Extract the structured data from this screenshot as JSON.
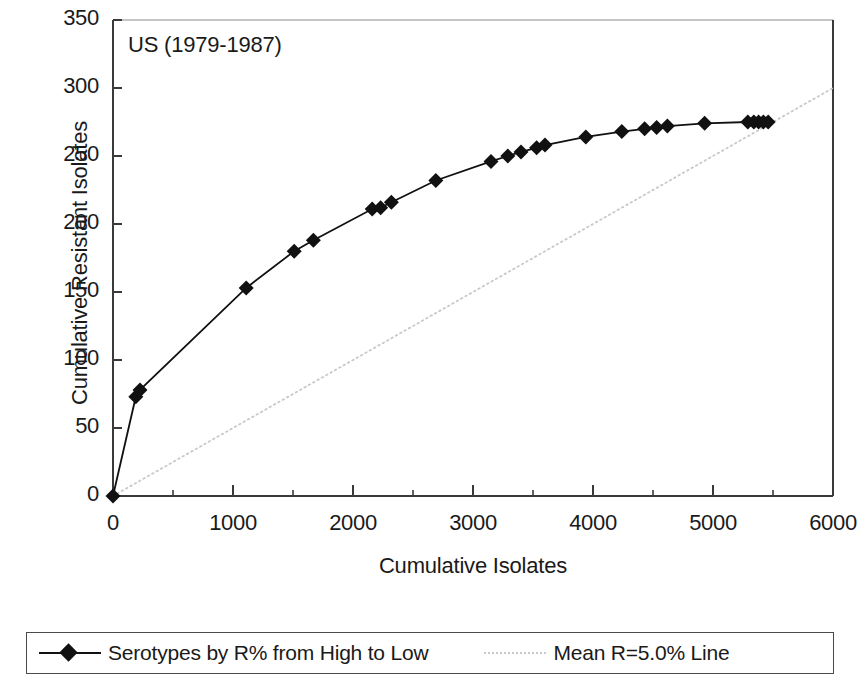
{
  "panel": {
    "annotation": "US (1979-1987)"
  },
  "legend": {
    "entries": [
      {
        "label": "Serotypes by R% from High to Low",
        "marker": "diamond-line",
        "color": "#111111"
      },
      {
        "label": "Mean R=5.0% Line",
        "marker": "dotted-line",
        "color": "#c9c9c9"
      }
    ]
  },
  "chart_data": {
    "type": "line",
    "title": "US (1979-1987)",
    "xlabel": "Cumulative Isolates",
    "ylabel": "Cumulative Resistant Isolates",
    "xlim": [
      0,
      6000
    ],
    "ylim": [
      0,
      350
    ],
    "xticks": [
      0,
      1000,
      2000,
      3000,
      4000,
      5000,
      6000
    ],
    "xtick_labels": [
      "0",
      "1000",
      "2000",
      "3000",
      "4000",
      "5000",
      "6000"
    ],
    "xminor_step": 500,
    "yticks": [
      0,
      50,
      100,
      150,
      200,
      250,
      300,
      350
    ],
    "ytick_labels": [
      "0",
      "50",
      "100",
      "150",
      "200",
      "250",
      "300",
      "350"
    ],
    "grid": false,
    "legend_position": "below",
    "series": [
      {
        "name": "Serotypes by R% from High to Low",
        "marker": "diamond",
        "color": "#111111",
        "points": [
          [
            0,
            0
          ],
          [
            190,
            73
          ],
          [
            225,
            78
          ],
          [
            1110,
            153
          ],
          [
            1510,
            180
          ],
          [
            1670,
            188
          ],
          [
            2160,
            211
          ],
          [
            2230,
            212
          ],
          [
            2320,
            216
          ],
          [
            2690,
            232
          ],
          [
            3150,
            246
          ],
          [
            3290,
            250
          ],
          [
            3400,
            253
          ],
          [
            3530,
            256
          ],
          [
            3600,
            258
          ],
          [
            3940,
            264
          ],
          [
            4240,
            268
          ],
          [
            4430,
            270
          ],
          [
            4530,
            271
          ],
          [
            4620,
            272
          ],
          [
            4930,
            274
          ],
          [
            5290,
            275
          ],
          [
            5340,
            275
          ],
          [
            5380,
            275
          ],
          [
            5420,
            275
          ],
          [
            5460,
            275
          ]
        ]
      },
      {
        "name": "Mean R=5.0% Line",
        "marker": "none",
        "style": "dotted",
        "color": "#c9c9c9",
        "points": [
          [
            0,
            0
          ],
          [
            6000,
            300
          ]
        ]
      }
    ]
  }
}
